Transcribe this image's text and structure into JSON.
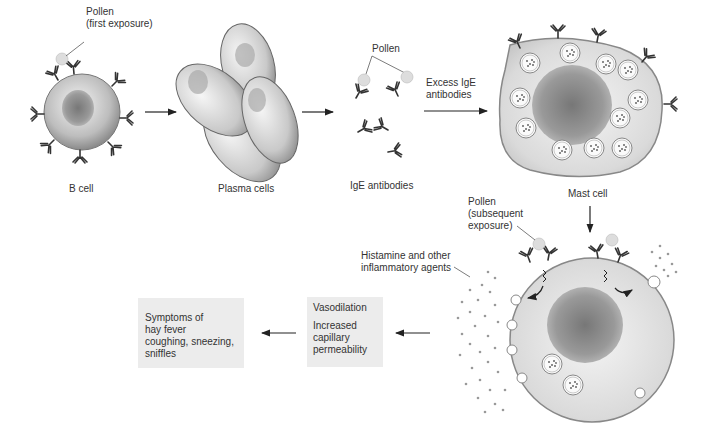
{
  "diagram": {
    "stages": {
      "b_cell": {
        "label": "B cell"
      },
      "plasma_cells": {
        "label": "Plasma cells"
      },
      "ige_antibodies": {
        "label": "IgE antibodies"
      },
      "mast_cell": {
        "label": "Mast cell"
      }
    },
    "annotations": {
      "pollen_first": {
        "line1": "Pollen",
        "line2": "(first exposure)"
      },
      "pollen_ige": "Pollen",
      "excess_ige": {
        "line1": "Excess IgE",
        "line2": "antibodies"
      },
      "pollen_subsequent": {
        "line1": "Pollen",
        "line2": "(subsequent",
        "line3": "exposure)"
      },
      "histamine": {
        "line1": "Histamine and other",
        "line2": "inflammatory agents"
      }
    },
    "boxes": {
      "vasodilation": {
        "line1": "Vasodilation",
        "line2": "Increased",
        "line3": "capillary",
        "line4": "permeability"
      },
      "symptoms": {
        "line1": "Symptoms of",
        "line2": "hay fever",
        "line3": "coughing, sneezing,",
        "line4": "sniffles"
      }
    },
    "colors": {
      "background": "#ffffff",
      "box_fill": "#ececec",
      "text": "#333333",
      "antibody": "#333333",
      "cell_fill": "#dcdcdc"
    }
  }
}
